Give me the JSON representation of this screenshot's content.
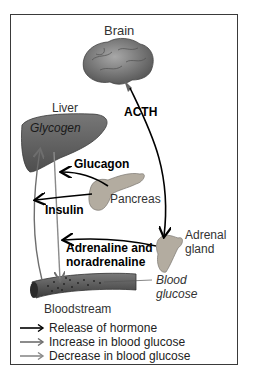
{
  "diagram": {
    "organs": {
      "brain": "Brain",
      "liver": "Liver",
      "liver_store": "Glycogen",
      "pancreas": "Pancreas",
      "adrenal": [
        "Adrenal",
        "gland"
      ],
      "bloodstream": "Bloodstream",
      "blood_glucose": [
        "Blood",
        "glucose"
      ]
    },
    "hormones": {
      "acth": "ACTH",
      "glucagon": "Glucagon",
      "insulin": "Insulin",
      "adrenaline": [
        "Adrenaline and",
        "noradrenaline"
      ]
    },
    "legend": [
      {
        "label": "Release of hormone",
        "color": "#000000"
      },
      {
        "label": "Increase in blood glucose",
        "color": "#6e6e6e"
      },
      {
        "label": "Decrease in blood glucose",
        "color": "#8a8a8a"
      }
    ],
    "colors": {
      "frame": "#3a3a3a",
      "liver": "#5f5f5f",
      "brain": "#8a8a8a",
      "gland": "#b0aaa0",
      "vessel": "#555555"
    }
  }
}
